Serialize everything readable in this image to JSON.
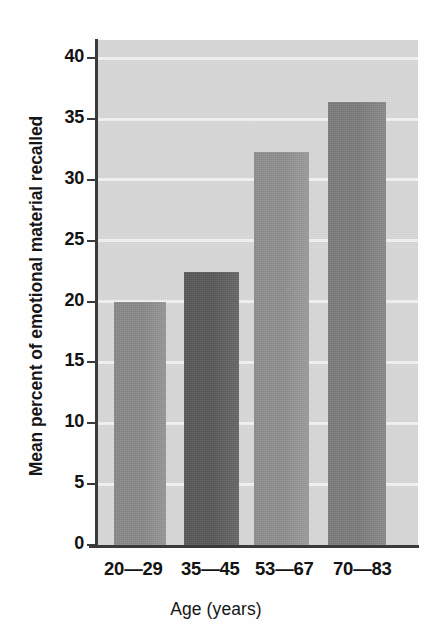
{
  "figure": {
    "background_color": "#fefefe",
    "plot_background_color": "#d9d9d9",
    "gridline_color": "#f4f4f4",
    "axis_color": "#3a3a3a",
    "text_color": "#131313"
  },
  "chart_data": {
    "type": "bar",
    "title": "",
    "subtitle": "",
    "xlabel": "Age (years)",
    "ylabel": "Mean percent of emotional material recalled",
    "categories": [
      "20—29",
      "35—45",
      "53—67",
      "70—83"
    ],
    "values": [
      20.0,
      22.4,
      32.3,
      36.4
    ],
    "ylim": [
      0,
      41.5
    ],
    "yticks": [
      0,
      5,
      10,
      15,
      20,
      25,
      30,
      35,
      40
    ],
    "ytick_labels": [
      "0",
      "5",
      "10",
      "15",
      "20",
      "25",
      "30",
      "35",
      "40"
    ],
    "xticks": [],
    "grid": true,
    "grid_axis": "y",
    "legend": false,
    "legend_position": "none",
    "bar_colors": [
      "#8b8b8b",
      "#5b5b5b",
      "#909090",
      "#7e7e7e"
    ],
    "series": [
      {
        "name": "Mean percent of emotional material recalled",
        "values": [
          20.0,
          22.4,
          32.3,
          36.4
        ]
      }
    ]
  }
}
